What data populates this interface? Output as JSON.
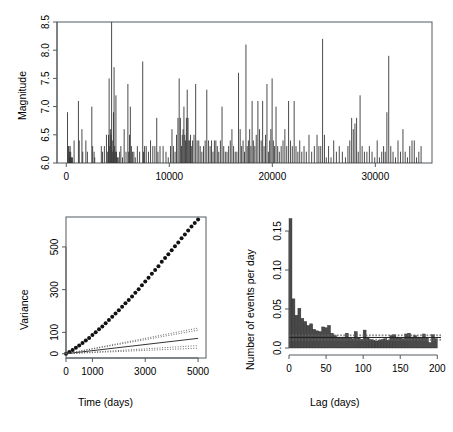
{
  "figure": {
    "title": "",
    "panels": [
      "magnitude-time-series",
      "variance-time",
      "lag-histogram"
    ]
  },
  "chart_data": [
    {
      "type": "bar",
      "panel": "magnitude-time-series",
      "title": "",
      "xlabel": "",
      "ylabel": "Magnitude",
      "xlim": [
        -900,
        35500
      ],
      "ylim": [
        6.0,
        8.5
      ],
      "xticks": [
        0,
        10000,
        20000,
        30000
      ],
      "xticklabels": [
        "0",
        "10000",
        "20000",
        "30000"
      ],
      "yticks": [
        6.0,
        6.5,
        7.0,
        7.5,
        8.0,
        8.5
      ],
      "yticklabels": [
        "6.0",
        "6.5",
        "7.0",
        "7.5",
        "8.0",
        "8.5"
      ],
      "grid": false,
      "legend": null,
      "x": [
        120,
        200,
        260,
        300,
        340,
        380,
        430,
        470,
        520,
        600,
        760,
        1180,
        1260,
        1520,
        1600,
        1900,
        2050,
        2480,
        2560,
        2700,
        2760,
        3400,
        3520,
        3700,
        3900,
        4020,
        4100,
        4160,
        4220,
        4280,
        4340,
        4400,
        4460,
        4520,
        4580,
        4640,
        4700,
        4760,
        4820,
        4880,
        4960,
        5040,
        5180,
        5300,
        5460,
        5620,
        5800,
        5980,
        6060,
        6140,
        6220,
        6320,
        6420,
        6560,
        6700,
        6900,
        7120,
        7420,
        7500,
        7600,
        7760,
        7980,
        8180,
        8400,
        8600,
        8780,
        8900,
        9100,
        9400,
        9680,
        9900,
        10120,
        10260,
        10400,
        10560,
        10700,
        10840,
        10960,
        11080,
        11180,
        11260,
        11340,
        11420,
        11500,
        11580,
        11660,
        11740,
        11820,
        11900,
        11980,
        12060,
        12140,
        12260,
        12400,
        12560,
        12700,
        12860,
        13000,
        13160,
        13320,
        13480,
        13640,
        13800,
        13960,
        14100,
        14240,
        14380,
        14520,
        14660,
        14800,
        14960,
        15120,
        15280,
        15440,
        15600,
        15760,
        15920,
        16080,
        16240,
        16400,
        16560,
        16720,
        16880,
        17020,
        17160,
        17300,
        17440,
        17560,
        17680,
        17800,
        17920,
        18040,
        18160,
        18300,
        18440,
        18600,
        18760,
        18920,
        19060,
        19200,
        19340,
        19480,
        19620,
        19740,
        19860,
        19980,
        20100,
        20220,
        20360,
        20520,
        20680,
        20860,
        21040,
        21220,
        21400,
        21580,
        21760,
        21940,
        22120,
        22300,
        22480,
        22660,
        22860,
        23080,
        23300,
        23560,
        23820,
        24080,
        24340,
        24520,
        24700,
        24880,
        25060,
        25240,
        25460,
        25700,
        25960,
        26220,
        26500,
        26800,
        27100,
        27340,
        27520,
        27700,
        27860,
        28020,
        28180,
        28340,
        28520,
        28720,
        28940,
        29180,
        29420,
        29680,
        29940,
        30180,
        30400,
        30620,
        30800,
        30960,
        31120,
        31300,
        31500,
        31720,
        31960,
        32200,
        32440,
        32680,
        32900,
        33120,
        33340,
        33560,
        33780,
        34000,
        34220,
        34440
      ],
      "magnitudes": [
        6.9,
        6.3,
        6.3,
        6.2,
        6.1,
        6.3,
        6.2,
        6.1,
        6.1,
        6.1,
        6.4,
        7.1,
        6.4,
        6.6,
        6.2,
        6.4,
        6.2,
        7.0,
        6.3,
        6.2,
        6.1,
        6.3,
        6.2,
        6.3,
        6.5,
        6.2,
        6.5,
        7.5,
        6.3,
        6.6,
        6.5,
        8.5,
        6.4,
        6.2,
        6.9,
        7.7,
        6.3,
        6.2,
        7.2,
        6.2,
        6.1,
        6.1,
        6.2,
        6.3,
        6.1,
        6.6,
        6.2,
        7.4,
        6.2,
        6.5,
        7.0,
        6.3,
        6.2,
        6.2,
        6.1,
        6.3,
        6.2,
        7.8,
        6.2,
        6.3,
        6.3,
        6.2,
        6.4,
        6.3,
        6.3,
        6.8,
        6.2,
        6.3,
        6.3,
        6.2,
        6.1,
        6.3,
        6.6,
        6.3,
        6.2,
        6.5,
        6.8,
        7.5,
        6.8,
        6.3,
        6.5,
        6.6,
        7.0,
        6.5,
        6.4,
        6.8,
        7.3,
        6.8,
        6.4,
        6.4,
        6.5,
        6.3,
        6.4,
        6.5,
        7.4,
        6.4,
        6.4,
        6.3,
        6.2,
        6.3,
        6.4,
        7.3,
        6.4,
        6.3,
        6.4,
        6.2,
        6.4,
        6.4,
        6.3,
        6.2,
        6.4,
        7.0,
        6.3,
        6.2,
        6.2,
        6.3,
        6.4,
        6.6,
        6.3,
        6.2,
        6.2,
        7.6,
        6.6,
        6.3,
        6.4,
        6.2,
        8.1,
        6.3,
        6.4,
        6.6,
        6.3,
        7.1,
        6.4,
        6.3,
        6.5,
        7.1,
        6.6,
        6.4,
        7.1,
        6.3,
        6.5,
        7.4,
        6.2,
        6.4,
        6.6,
        7.5,
        6.4,
        6.3,
        7.0,
        6.3,
        6.2,
        6.3,
        6.4,
        6.6,
        6.3,
        7.1,
        6.4,
        6.3,
        7.1,
        6.3,
        6.2,
        6.4,
        6.2,
        6.3,
        6.2,
        6.5,
        6.2,
        6.3,
        6.5,
        6.3,
        6.3,
        8.2,
        6.5,
        6.1,
        6.3,
        6.1,
        6.4,
        6.2,
        6.3,
        6.2,
        6.1,
        6.3,
        6.4,
        6.8,
        6.6,
        6.7,
        6.8,
        6.2,
        7.2,
        6.3,
        6.2,
        6.2,
        6.3,
        6.2,
        6.1,
        6.4,
        6.1,
        6.2,
        6.3,
        6.2,
        6.9,
        7.9,
        6.3,
        6.2,
        6.1,
        6.4,
        6.2,
        6.6,
        6.2,
        6.1,
        6.3,
        6.4,
        6.4,
        6.1,
        6.2,
        6.3,
        6.1,
        6.2,
        6.1,
        6.3,
        7.4,
        6.2,
        6.5,
        6.1
      ]
    },
    {
      "type": "scatter",
      "panel": "variance-time",
      "title": "",
      "xlabel": "Time (days)",
      "ylabel": "Variance",
      "xlim": [
        0,
        5300
      ],
      "ylim": [
        -20,
        640
      ],
      "xticks": [
        0,
        1000,
        3000,
        5000
      ],
      "xticklabels": [
        "0",
        "1000",
        "3000",
        "5000"
      ],
      "yticks": [
        0,
        100,
        300,
        500
      ],
      "yticklabels": [
        "0",
        "100",
        "300",
        "500"
      ],
      "grid": false,
      "legend": null,
      "series": [
        {
          "name": "empirical-variance-points",
          "style": "points",
          "x": [
            0,
            125,
            250,
            375,
            500,
            625,
            750,
            875,
            1000,
            1125,
            1250,
            1375,
            1500,
            1625,
            1750,
            1875,
            2000,
            2125,
            2250,
            2375,
            2500,
            2625,
            2750,
            2875,
            3000,
            3125,
            3250,
            3375,
            3500,
            3625,
            3750,
            3875,
            4000,
            4125,
            4250,
            4375,
            4500,
            4625,
            4750,
            4875,
            5000
          ],
          "y": [
            0,
            8,
            18,
            28,
            38,
            50,
            62,
            74,
            88,
            100,
            114,
            128,
            143,
            158,
            173,
            188,
            203,
            220,
            236,
            252,
            268,
            285,
            302,
            320,
            338,
            356,
            374,
            392,
            410,
            430,
            448,
            466,
            484,
            503,
            521,
            540,
            558,
            577,
            595,
            612,
            628
          ]
        },
        {
          "name": "poisson-expectation-solid",
          "style": "solid-line",
          "x": [
            0,
            5000
          ],
          "y": [
            0,
            72
          ]
        },
        {
          "name": "confidence-upper-outer",
          "style": "dotted-line",
          "x": [
            0,
            5000
          ],
          "y": [
            0,
            120
          ]
        },
        {
          "name": "confidence-upper-inner",
          "style": "dotted-line",
          "x": [
            0,
            5000
          ],
          "y": [
            0,
            110
          ]
        },
        {
          "name": "confidence-lower-inner",
          "style": "dotted-line",
          "x": [
            0,
            5000
          ],
          "y": [
            0,
            38
          ]
        },
        {
          "name": "confidence-lower-outer",
          "style": "dotted-line",
          "x": [
            0,
            5000
          ],
          "y": [
            0,
            26
          ]
        }
      ]
    },
    {
      "type": "bar",
      "panel": "lag-histogram",
      "title": "",
      "xlabel": "Lag (days)",
      "ylabel": "Number of events per day",
      "xlim": [
        0,
        205
      ],
      "ylim": [
        0,
        0.168
      ],
      "xticks": [
        0,
        50,
        100,
        150,
        200
      ],
      "xticklabels": [
        "0",
        "50",
        "100",
        "150",
        "200"
      ],
      "yticks": [
        0.0,
        0.05,
        0.1,
        0.15
      ],
      "yticklabels": [
        "0.0",
        "0.05",
        "0.10",
        "0.15"
      ],
      "grid": false,
      "legend": null,
      "bin_width": 4,
      "bin_starts": [
        0,
        4,
        8,
        12,
        16,
        20,
        24,
        28,
        32,
        36,
        40,
        44,
        48,
        52,
        56,
        60,
        64,
        68,
        72,
        76,
        80,
        84,
        88,
        92,
        96,
        100,
        104,
        108,
        112,
        116,
        120,
        124,
        128,
        132,
        136,
        140,
        144,
        148,
        152,
        156,
        160,
        164,
        168,
        172,
        176,
        180,
        184,
        188,
        192,
        196
      ],
      "values": [
        0.166,
        0.063,
        0.042,
        0.051,
        0.038,
        0.034,
        0.029,
        0.031,
        0.024,
        0.022,
        0.021,
        0.027,
        0.026,
        0.029,
        0.019,
        0.016,
        0.014,
        0.013,
        0.014,
        0.019,
        0.013,
        0.012,
        0.021,
        0.013,
        0.011,
        0.023,
        0.014,
        0.011,
        0.01,
        0.009,
        0.01,
        0.011,
        0.012,
        0.01,
        0.016,
        0.017,
        0.014,
        0.013,
        0.012,
        0.018,
        0.019,
        0.014,
        0.016,
        0.014,
        0.013,
        0.018,
        0.013,
        0.007,
        0.017,
        0.012
      ],
      "reference_lines": [
        {
          "name": "mean-rate-solid",
          "value": 0.0135,
          "style": "solid"
        },
        {
          "name": "upper-confidence-dashed",
          "value": 0.0168,
          "style": "dashed"
        },
        {
          "name": "upper-confidence-dashed-2",
          "value": 0.0158,
          "style": "dashed"
        },
        {
          "name": "lower-confidence-dashed",
          "value": 0.0112,
          "style": "dashed"
        },
        {
          "name": "lower-confidence-dashed-2",
          "value": 0.01,
          "style": "dashed"
        }
      ]
    }
  ]
}
